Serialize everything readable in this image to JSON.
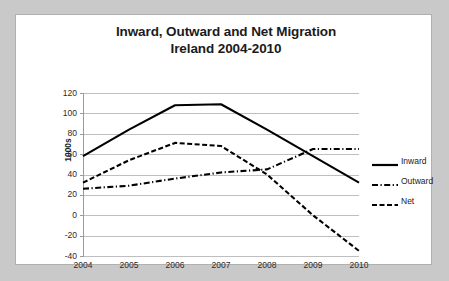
{
  "chart_data": {
    "type": "line",
    "title_line1": "Inward, Outward and Net Migration",
    "title_line2": "Ireland 2004-2010",
    "xlabel": "",
    "ylabel": "1000s",
    "x": [
      2004,
      2005,
      2006,
      2007,
      2008,
      2009,
      2010
    ],
    "categories": [
      "2004",
      "2005",
      "2006",
      "2007",
      "2008",
      "2009",
      "2010"
    ],
    "yticks": [
      120,
      100,
      80,
      60,
      40,
      20,
      0,
      -20,
      -40
    ],
    "ylim": [
      -40,
      120
    ],
    "grid": true,
    "legend_position": "right",
    "series": [
      {
        "name": "Inward",
        "style": "solid",
        "color": "#000000",
        "values": [
          58,
          84,
          108,
          109,
          84,
          58,
          32
        ]
      },
      {
        "name": "Outward",
        "style": "dash-dot",
        "color": "#000000",
        "values": [
          26,
          29,
          36,
          42,
          45,
          65,
          65
        ]
      },
      {
        "name": "Net",
        "style": "dashed",
        "color": "#000000",
        "values": [
          32,
          54,
          71,
          68,
          40,
          0,
          -35
        ]
      }
    ]
  },
  "legend": {
    "items": [
      {
        "label": "Inward",
        "style": "solid"
      },
      {
        "label": "Outward",
        "style": "dash-dot"
      },
      {
        "label": "Net",
        "style": "dashed"
      }
    ]
  }
}
